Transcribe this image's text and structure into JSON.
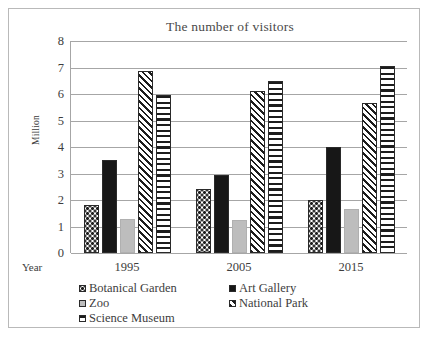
{
  "chart_data": {
    "type": "bar",
    "title": "The number of visitors",
    "xlabel": "Year",
    "ylabel": "Million",
    "ylim": [
      0,
      8
    ],
    "yticks": [
      "0",
      "1",
      "2",
      "3",
      "4",
      "5",
      "6",
      "7",
      "8"
    ],
    "grid": true,
    "legend_position": "bottom",
    "categories": [
      "1995",
      "2005",
      "2015"
    ],
    "series": [
      {
        "name": "Botanical Garden",
        "pattern": "dots",
        "color": "#1c1c1c",
        "values": [
          1.8,
          2.4,
          2.0
        ]
      },
      {
        "name": "Art Gallery",
        "pattern": "solid-black",
        "color": "#171717",
        "values": [
          3.5,
          2.95,
          4.0
        ]
      },
      {
        "name": "Zoo",
        "pattern": "solid-gray",
        "color": "#bdbdbd",
        "values": [
          1.3,
          1.25,
          1.65
        ]
      },
      {
        "name": "National Park",
        "pattern": "diagonal",
        "color": "#1c1c1c",
        "values": [
          6.85,
          6.1,
          5.65
        ]
      },
      {
        "name": "Science Museum",
        "pattern": "h-stripe",
        "color": "#1c1c1c",
        "values": [
          5.95,
          6.5,
          7.05
        ]
      }
    ]
  }
}
